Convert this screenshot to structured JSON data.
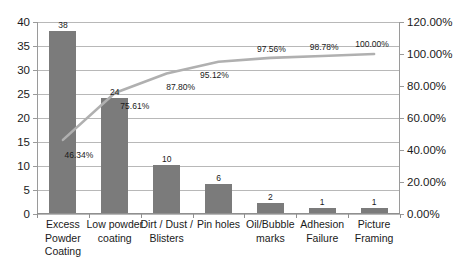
{
  "chart_data": {
    "type": "bar",
    "title": "",
    "subtitle": "",
    "xlabel": "",
    "ylabel": "",
    "y2label": "",
    "grid": true,
    "legend": false,
    "categories": [
      "Excess Powder Coating",
      "Low powder coating",
      "Dirt / Dust / Blisters",
      "Pin holes",
      "Oil/Bubble marks",
      "Adhesion Failure",
      "Picture Framing"
    ],
    "series": [
      {
        "name": "Count",
        "type": "bar",
        "axis": "left",
        "values": [
          38,
          24,
          10,
          6,
          2,
          1,
          1
        ],
        "value_labels": [
          "38",
          "24",
          "10",
          "6",
          "2",
          "1",
          "1"
        ],
        "color": "#7b7b7b"
      },
      {
        "name": "Cumulative %",
        "type": "line",
        "axis": "right",
        "values": [
          46.34,
          75.61,
          87.8,
          95.12,
          97.56,
          98.78,
          100.0
        ],
        "value_labels": [
          "46.34%",
          "75.61%",
          "87.80%",
          "95.12%",
          "97.56%",
          "98.78%",
          "100.00%"
        ],
        "color": "#b0b0b0"
      }
    ],
    "ylim": [
      0,
      40
    ],
    "yticks": [
      0,
      5,
      10,
      15,
      20,
      25,
      30,
      35,
      40
    ],
    "ytick_labels": [
      "0",
      "5",
      "10",
      "15",
      "20",
      "25",
      "30",
      "35",
      "40"
    ],
    "y2lim": [
      0,
      120
    ],
    "y2ticks": [
      0,
      20,
      40,
      60,
      80,
      100,
      120
    ],
    "y2tick_labels": [
      "0.00%",
      "20.00%",
      "40.00%",
      "60.00%",
      "80.00%",
      "100.00%",
      "120.00%"
    ]
  },
  "colors": {
    "bar": "#7b7b7b",
    "line": "#b0b0b0",
    "grid": "#b8b8b8",
    "axis": "#9a9a9a",
    "text": "#1a1a1a",
    "background": "#ffffff"
  }
}
